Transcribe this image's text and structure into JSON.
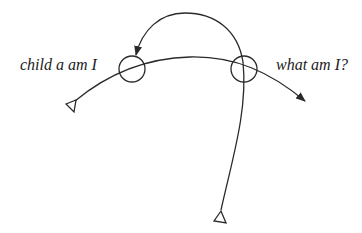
{
  "diagram": {
    "labels": {
      "left": "child a am I",
      "right": "what am I?"
    },
    "colors": {
      "stroke": "#2a2a2a",
      "background": "#ffffff",
      "text": "#222222"
    },
    "nodes": [
      {
        "id": "left-circle",
        "shape": "circle",
        "cx": 132,
        "cy": 69,
        "r": 13
      },
      {
        "id": "right-circle",
        "shape": "circle",
        "cx": 244,
        "cy": 69,
        "r": 13
      }
    ],
    "edges": [
      {
        "id": "main-curve",
        "from": "left-triangle",
        "via": [
          "left-circle",
          "right-circle"
        ],
        "to": "arrow-right"
      },
      {
        "id": "top-arc",
        "from": "right-circle",
        "to": "left-circle",
        "arrow": true
      },
      {
        "id": "vertical-line",
        "from": "bottom-triangle",
        "to": "right-circle"
      }
    ],
    "markers": [
      {
        "id": "left-triangle",
        "shape": "open-triangle"
      },
      {
        "id": "bottom-triangle",
        "shape": "open-triangle"
      }
    ]
  }
}
